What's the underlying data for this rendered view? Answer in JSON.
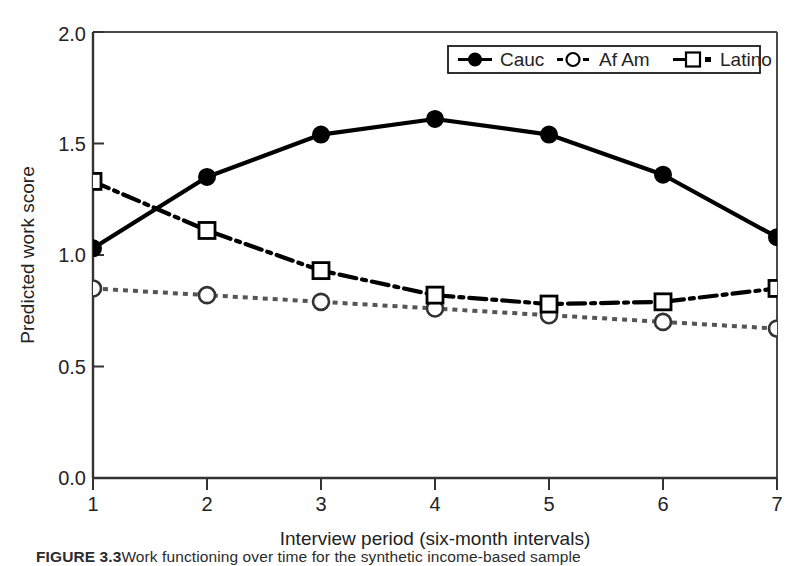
{
  "chart_data": {
    "type": "line",
    "title": "",
    "xlabel": "Interview period (six-month intervals)",
    "ylabel": "Predicted work score",
    "x": [
      1,
      2,
      3,
      4,
      5,
      6,
      7
    ],
    "xtick_labels": [
      "1",
      "2",
      "3",
      "4",
      "5",
      "6",
      "7"
    ],
    "ytick_labels": [
      "0.0",
      "0.5",
      "1.0",
      "1.5",
      "2.0"
    ],
    "ytick_values": [
      0.0,
      0.5,
      1.0,
      1.5,
      2.0
    ],
    "xlim": [
      1,
      7
    ],
    "ylim": [
      0.0,
      2.0
    ],
    "grid": false,
    "legend_position": "top-right",
    "series": [
      {
        "name": "Cauc",
        "values": [
          1.03,
          1.35,
          1.54,
          1.61,
          1.54,
          1.36,
          1.08
        ],
        "line_style": "solid",
        "marker": "filled-circle",
        "color": "#000000"
      },
      {
        "name": "Af Am",
        "values": [
          0.85,
          0.82,
          0.79,
          0.76,
          0.73,
          0.7,
          0.67
        ],
        "line_style": "dotted",
        "marker": "open-circle",
        "color": "#555555"
      },
      {
        "name": "Latino",
        "values": [
          1.33,
          1.11,
          0.93,
          0.82,
          0.78,
          0.79,
          0.85
        ],
        "line_style": "dash-dot",
        "marker": "open-square",
        "color": "#000000"
      }
    ]
  },
  "legend": {
    "entries": [
      {
        "label": "Cauc"
      },
      {
        "label": "Af Am"
      },
      {
        "label": "Latino"
      }
    ]
  },
  "caption": {
    "figure_number": "FIGURE 3.3",
    "text": "Work functioning over time for the synthetic income-based sample"
  }
}
